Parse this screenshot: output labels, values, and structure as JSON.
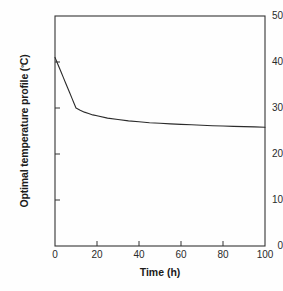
{
  "figure": {
    "background_color": "#fefefe",
    "axis_color": "#333333",
    "line_color": "#2b2b2b"
  },
  "axis_titles": {
    "y_prefix": "Optimal temperature profile (",
    "y_degree": "º",
    "y_suffix": "C)",
    "y_full": "Optimal temperature profile (ºC)",
    "x": "Time (h)"
  },
  "ticks": {
    "y": [
      "0",
      "10",
      "20",
      "30",
      "40",
      "50"
    ],
    "x": [
      "0",
      "20",
      "40",
      "60",
      "80",
      "100"
    ]
  },
  "chart_data": {
    "type": "line",
    "title": "",
    "subtitle": "",
    "xlabel": "Time (h)",
    "ylabel": "Optimal temperature profile (ºC)",
    "xlim": [
      0,
      100
    ],
    "ylim": [
      0,
      50
    ],
    "xticks": [
      0,
      20,
      40,
      60,
      80,
      100
    ],
    "yticks": [
      0,
      10,
      20,
      30,
      40,
      50
    ],
    "grid": false,
    "legend": null,
    "legend_position": "none",
    "annotations": [],
    "series": [
      {
        "name": "Optimal temperature profile",
        "color": "#2b2b2b",
        "x": [
          0,
          1,
          2,
          3,
          4,
          5,
          6,
          7,
          8,
          9,
          10,
          12,
          14,
          16,
          18,
          20,
          25,
          30,
          35,
          40,
          45,
          50,
          55,
          60,
          65,
          70,
          75,
          80,
          85,
          90,
          95,
          100
        ],
        "y": [
          41.0,
          39.9,
          38.8,
          37.7,
          36.6,
          35.5,
          34.4,
          33.3,
          32.2,
          31.1,
          30.0,
          29.5,
          29.1,
          28.8,
          28.5,
          28.3,
          27.8,
          27.5,
          27.2,
          27.0,
          26.8,
          26.7,
          26.55,
          26.45,
          26.35,
          26.25,
          26.15,
          26.1,
          26.0,
          25.95,
          25.9,
          25.8
        ]
      }
    ]
  }
}
